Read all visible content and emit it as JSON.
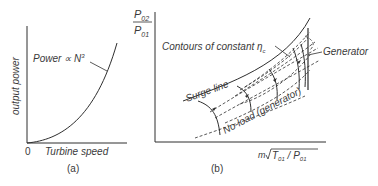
{
  "figure_a": {
    "caption": "(a)",
    "y_axis_label": "output power",
    "x_axis_label": "Turbine speed",
    "origin_label": "0",
    "curve_label_prefix": "Power ∝ N",
    "curve_label_exp": "3"
  },
  "figure_b": {
    "caption": "(b)",
    "y_axis_num": "P",
    "y_axis_num_sub": "02",
    "y_axis_den": "P",
    "y_axis_den_sub": "01",
    "x_axis_label_m": "m",
    "x_axis_label_T": "T",
    "x_axis_label_T_sub": "01",
    "x_axis_label_sep": " / P",
    "x_axis_label_P_sub": "01",
    "contours_label": "Contours of constant η",
    "contours_label_sub": "c",
    "generator_label": "Generator",
    "surge_label": "Surge line",
    "noload_label": "No-load (generator)"
  },
  "colors": {
    "line": "#2e2e2e",
    "text": "#3a3a3a",
    "background": "#ffffff"
  }
}
